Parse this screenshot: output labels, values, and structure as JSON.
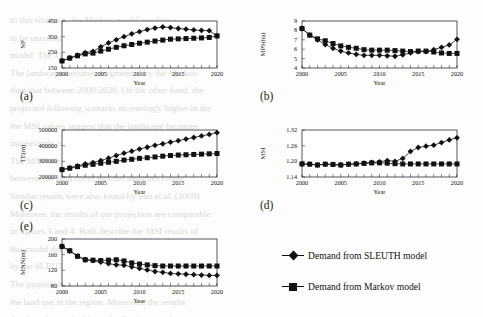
{
  "background_text": "to this situation, the Markov model predicts a\nto be unconstrained and the demand for land\nmodel. The TE projected by the SLEUTH model\nThe landscape becomes fragmented by the Markov\nthan that between 2000-2020. On the other hand, the\nprojected following scenario increasingly higher in the\nthe MSI values suggest that the landscape becomes\nincreasingly complex under the SLEUTH projection\nThe MNN decreases steadily over the simulation\nbetween the land cover patches becomes closer.\nSimilar results were also found by Sun et al. (2000)\nMoreover, the results of our projection are comparable\nin figures 3 and 4. Both describe the MSI results of\nthis model does not affect the form the modelled\nby the SLEUTH model, more patches with a reduced\nThe projected MSI and MNN the patch shape index\nthe land use in the region. Moreover, the results\ndeveloped areas in this study. Our in more than a\nthese results are also consistent with the findings",
  "figure": {
    "legend": [
      {
        "label": "Demand from SLEUTH model",
        "marker": "diamond",
        "color": "#111111"
      },
      {
        "label": "Demand from Markov model",
        "marker": "square",
        "color": "#111111"
      }
    ],
    "panels": [
      {
        "tag": "(a)",
        "ylabel": "NP",
        "xlabel": "Year"
      },
      {
        "tag": "(b)",
        "ylabel": "MPS(ha)",
        "xlabel": "Year"
      },
      {
        "tag": "(c)",
        "ylabel": "TE(m)",
        "xlabel": "Year"
      },
      {
        "tag": "(d)",
        "ylabel": "MSI",
        "xlabel": "Year"
      },
      {
        "tag": "(e)",
        "ylabel": "MNN(m)",
        "xlabel": "Year"
      }
    ]
  },
  "chart_data": [
    {
      "type": "line",
      "panel": "(a)",
      "title": "",
      "xlabel": "Year",
      "ylabel": "NP",
      "xlim": [
        2000,
        2020
      ],
      "ylim": [
        150,
        450
      ],
      "yticks": [
        150,
        250,
        350,
        450
      ],
      "xticks": [
        2000,
        2005,
        2010,
        2015,
        2020
      ],
      "grid": false,
      "legend_position": "external-bottom-right",
      "x": [
        2000,
        2001,
        2002,
        2003,
        2004,
        2005,
        2006,
        2007,
        2008,
        2009,
        2010,
        2011,
        2012,
        2013,
        2014,
        2015,
        2016,
        2017,
        2018,
        2019,
        2020
      ],
      "series": [
        {
          "name": "Demand from SLEUTH model",
          "marker": "diamond",
          "values": [
            195,
            215,
            232,
            248,
            256,
            285,
            310,
            330,
            350,
            368,
            382,
            395,
            405,
            412,
            408,
            402,
            398,
            393,
            390,
            388,
            355
          ]
        },
        {
          "name": "Demand from Markov model",
          "marker": "square",
          "values": [
            195,
            213,
            228,
            240,
            245,
            258,
            270,
            282,
            292,
            300,
            308,
            315,
            322,
            328,
            334,
            336,
            338,
            340,
            342,
            345,
            355
          ]
        }
      ]
    },
    {
      "type": "line",
      "panel": "(b)",
      "title": "",
      "xlabel": "Year",
      "ylabel": "MPS(ha)",
      "xlim": [
        2000,
        2020
      ],
      "ylim": [
        4,
        9
      ],
      "yticks": [
        4,
        5,
        6,
        7,
        8,
        9
      ],
      "xticks": [
        2000,
        2005,
        2010,
        2015,
        2020
      ],
      "grid": false,
      "legend_position": "external-bottom-right",
      "x": [
        2000,
        2001,
        2002,
        2003,
        2004,
        2005,
        2006,
        2007,
        2008,
        2009,
        2010,
        2011,
        2012,
        2013,
        2014,
        2015,
        2016,
        2017,
        2018,
        2019,
        2020
      ],
      "series": [
        {
          "name": "Demand from SLEUTH model",
          "marker": "diamond",
          "values": [
            8.2,
            7.5,
            7.0,
            6.5,
            6.1,
            5.8,
            5.6,
            5.45,
            5.35,
            5.35,
            5.35,
            5.3,
            5.25,
            5.4,
            5.6,
            5.75,
            5.75,
            5.95,
            6.2,
            6.45,
            7.05
          ]
        },
        {
          "name": "Demand from Markov model",
          "marker": "square",
          "values": [
            8.2,
            7.5,
            7.1,
            6.9,
            6.6,
            6.35,
            6.2,
            6.1,
            5.95,
            5.9,
            5.9,
            5.9,
            5.85,
            5.8,
            5.75,
            5.8,
            5.8,
            5.7,
            5.6,
            5.55,
            5.55
          ]
        }
      ]
    },
    {
      "type": "line",
      "panel": "(c)",
      "title": "",
      "xlabel": "Year",
      "ylabel": "TE(m)",
      "xlim": [
        2000,
        2020
      ],
      "ylim": [
        200000,
        500000
      ],
      "yticks": [
        200000,
        300000,
        400000,
        500000
      ],
      "xticks": [
        2000,
        2005,
        2010,
        2015,
        2020
      ],
      "grid": false,
      "legend_position": "external-bottom-right",
      "x": [
        2000,
        2001,
        2002,
        2003,
        2004,
        2005,
        2006,
        2007,
        2008,
        2009,
        2010,
        2011,
        2012,
        2013,
        2014,
        2015,
        2016,
        2017,
        2018,
        2019,
        2020
      ],
      "series": [
        {
          "name": "Demand from SLEUTH model",
          "marker": "diamond",
          "values": [
            247000,
            258000,
            271000,
            283000,
            292000,
            305000,
            320000,
            337000,
            352000,
            365000,
            378000,
            390000,
            402000,
            412000,
            422000,
            432000,
            442000,
            452000,
            462000,
            472000,
            483000
          ]
        },
        {
          "name": "Demand from Markov model",
          "marker": "square",
          "values": [
            247000,
            256000,
            266000,
            275000,
            281000,
            288000,
            294000,
            300000,
            308000,
            313000,
            319000,
            323000,
            328000,
            333000,
            337000,
            340000,
            342000,
            344000,
            346000,
            348000,
            350000
          ]
        }
      ]
    },
    {
      "type": "line",
      "panel": "(d)",
      "title": "",
      "xlabel": "Year",
      "ylabel": "MSI",
      "xlim": [
        2000,
        2020
      ],
      "ylim": [
        1.14,
        1.32
      ],
      "yticks": [
        1.14,
        1.2,
        1.26,
        1.32
      ],
      "xticks": [
        2000,
        2005,
        2010,
        2015,
        2020
      ],
      "grid": false,
      "legend_position": "external-bottom-right",
      "x": [
        2000,
        2001,
        2002,
        2003,
        2004,
        2005,
        2006,
        2007,
        2008,
        2009,
        2010,
        2011,
        2012,
        2013,
        2014,
        2015,
        2016,
        2017,
        2018,
        2019,
        2020
      ],
      "series": [
        {
          "name": "Demand from SLEUTH model",
          "marker": "diamond",
          "values": [
            1.19,
            1.189,
            1.186,
            1.189,
            1.188,
            1.186,
            1.189,
            1.19,
            1.193,
            1.196,
            1.198,
            1.203,
            1.2,
            1.211,
            1.238,
            1.253,
            1.258,
            1.262,
            1.272,
            1.282,
            1.29
          ]
        },
        {
          "name": "Demand from Markov model",
          "marker": "square",
          "values": [
            1.19,
            1.189,
            1.186,
            1.189,
            1.188,
            1.186,
            1.189,
            1.19,
            1.192,
            1.194,
            1.194,
            1.193,
            1.191,
            1.19,
            1.19,
            1.19,
            1.19,
            1.19,
            1.19,
            1.19,
            1.19
          ]
        }
      ]
    },
    {
      "type": "line",
      "panel": "(e)",
      "title": "",
      "xlabel": "Year",
      "ylabel": "MNN(m)",
      "xlim": [
        2000,
        2020
      ],
      "ylim": [
        80,
        200
      ],
      "yticks": [
        80,
        120,
        160,
        200
      ],
      "xticks": [
        2000,
        2005,
        2010,
        2015,
        2020
      ],
      "grid": false,
      "legend_position": "external-bottom-right",
      "x": [
        2000,
        2001,
        2002,
        2003,
        2004,
        2005,
        2006,
        2007,
        2008,
        2009,
        2010,
        2011,
        2012,
        2013,
        2014,
        2015,
        2016,
        2017,
        2018,
        2019,
        2020
      ],
      "series": [
        {
          "name": "Demand from SLEUTH model",
          "marker": "diamond",
          "values": [
            181,
            170,
            156,
            147,
            145,
            141,
            137,
            134,
            133,
            129,
            125,
            121,
            117,
            115,
            112,
            111,
            110,
            109,
            108,
            107,
            107
          ]
        },
        {
          "name": "Demand from Markov model",
          "marker": "square",
          "values": [
            181,
            170,
            156,
            147,
            146,
            145,
            146,
            147,
            144,
            139,
            136,
            134,
            132,
            131,
            131,
            131,
            131,
            131,
            131,
            131,
            131
          ]
        }
      ]
    }
  ]
}
